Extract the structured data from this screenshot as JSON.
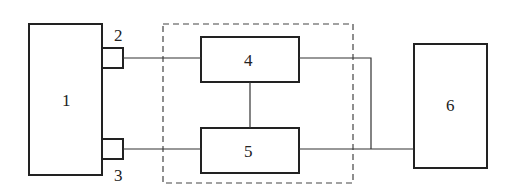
{
  "diagram": {
    "type": "block-diagram",
    "blocks": [
      {
        "id": "1",
        "label": "1"
      },
      {
        "id": "2",
        "label": "2"
      },
      {
        "id": "3",
        "label": "3"
      },
      {
        "id": "4",
        "label": "4"
      },
      {
        "id": "5",
        "label": "5"
      },
      {
        "id": "6",
        "label": "6"
      }
    ],
    "groups": [
      {
        "id": "dashed-group",
        "contains": [
          "4",
          "5"
        ]
      }
    ],
    "connections": [
      {
        "from": "2",
        "to": "4"
      },
      {
        "from": "3",
        "to": "5"
      },
      {
        "from": "4",
        "to": "5"
      },
      {
        "from": "4",
        "to": "6"
      },
      {
        "from": "5",
        "to": "6"
      }
    ]
  },
  "colors": {
    "line": "#222222",
    "background": "#ffffff"
  }
}
